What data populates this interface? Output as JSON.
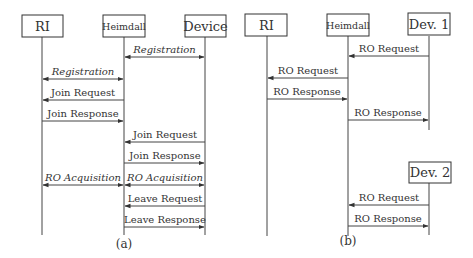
{
  "diagram_a": {
    "caption": "(a)",
    "participants": [
      {
        "name": "RI"
      },
      {
        "name": "Heimdall"
      },
      {
        "name": "Device"
      }
    ],
    "messages": [
      {
        "label": "Registration",
        "from": "Heimdall",
        "to": "Device",
        "bidirectional": true,
        "italic": true
      },
      {
        "label": "Registration",
        "from": "RI",
        "to": "Heimdall",
        "bidirectional": true,
        "italic": true
      },
      {
        "label": "Join Request",
        "from": "Heimdall",
        "to": "RI",
        "bidirectional": false,
        "italic": false
      },
      {
        "label": "Join Response",
        "from": "RI",
        "to": "Heimdall",
        "bidirectional": false,
        "italic": false
      },
      {
        "label": "Join Request",
        "from": "Device",
        "to": "Heimdall",
        "bidirectional": false,
        "italic": false
      },
      {
        "label": "Join Response",
        "from": "Heimdall",
        "to": "Device",
        "bidirectional": false,
        "italic": false
      },
      {
        "label": "RO Acquisition",
        "from": "RI",
        "to": "Heimdall",
        "bidirectional": true,
        "italic": true
      },
      {
        "label": "RO Acquisition",
        "from": "Heimdall",
        "to": "Device",
        "bidirectional": true,
        "italic": true
      },
      {
        "label": "Leave Request",
        "from": "Device",
        "to": "Heimdall",
        "bidirectional": false,
        "italic": false
      },
      {
        "label": "Leave Response",
        "from": "Heimdall",
        "to": "Device",
        "bidirectional": false,
        "italic": false
      }
    ]
  },
  "diagram_b": {
    "caption": "(b)",
    "participants": [
      {
        "name": "RI"
      },
      {
        "name": "Heimdall"
      },
      {
        "name": "Dev. 1"
      },
      {
        "name": "Dev. 2"
      }
    ],
    "messages": [
      {
        "label": "RO Request",
        "from": "Dev. 1",
        "to": "Heimdall",
        "bidirectional": false
      },
      {
        "label": "RO Request",
        "from": "Heimdall",
        "to": "RI",
        "bidirectional": false
      },
      {
        "label": "RO Response",
        "from": "RI",
        "to": "Heimdall",
        "bidirectional": false
      },
      {
        "label": "RO Response",
        "from": "Heimdall",
        "to": "Dev. 1",
        "bidirectional": false
      },
      {
        "label": "RO Request",
        "from": "Dev. 2",
        "to": "Heimdall",
        "bidirectional": false
      },
      {
        "label": "RO Response",
        "from": "Heimdall",
        "to": "Dev. 2",
        "bidirectional": false
      }
    ]
  }
}
